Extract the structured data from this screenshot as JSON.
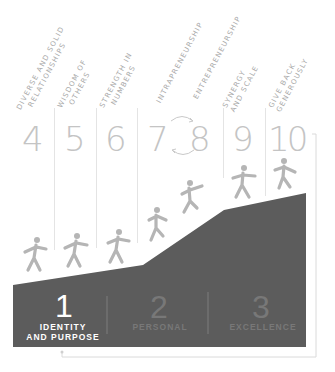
{
  "diagram": {
    "stairs": [
      {
        "number": "4",
        "label_line1": "DIVERSE AND SOLID",
        "label_line2": "RELATIONSHIPS"
      },
      {
        "number": "5",
        "label_line1": "WISDOM OF",
        "label_line2": "OTHERS"
      },
      {
        "number": "6",
        "label_line1": "STRENGTH IN",
        "label_line2": "NUMBERS"
      },
      {
        "number": "7",
        "label_line1": "INTRAPRENEURSHIP",
        "label_line2": ""
      },
      {
        "number": "8",
        "label_line1": "ENTREPRENEURSHIP",
        "label_line2": ""
      },
      {
        "number": "9",
        "label_line1": "SYNERGY",
        "label_line2": "AND SCALE"
      },
      {
        "number": "10",
        "label_line1": "GIVE BACK",
        "label_line2": "GENEROUSLY"
      }
    ],
    "base_stages": [
      {
        "number": "1",
        "label_line1": "IDENTITY",
        "label_line2": "AND PURPOSE"
      },
      {
        "number": "2",
        "label_line1": "PERSONAL",
        "label_line2": ""
      },
      {
        "number": "3",
        "label_line1": "EXCELLENCE",
        "label_line2": ""
      }
    ],
    "colors": {
      "mountain": "#5c5c5c",
      "figure": "#b5b5b5",
      "number": "#c4c4c4",
      "label": "#a9a9a9",
      "line": "#e4e4e4"
    }
  }
}
